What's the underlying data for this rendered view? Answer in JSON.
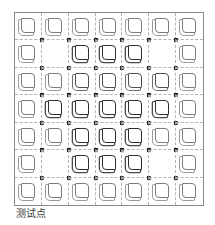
{
  "figure": {
    "caption": "测试点",
    "rows": 7,
    "cols": 7,
    "colors": {
      "border": "#8a8a8a",
      "grid_dashed": "#b5b5b5",
      "pad_normal": "#7c7c7c",
      "pad_medium": "#4f4f4f",
      "pad_bold": "#2e2e2e",
      "test_point": "#3a3a3a"
    },
    "cells": [
      [
        "normal",
        "normal",
        "normal",
        "normal",
        "normal",
        "normal",
        "normal"
      ],
      [
        "normal",
        "empty",
        "bold",
        "bold",
        "bold",
        "empty",
        "normal"
      ],
      [
        "normal",
        "normal",
        "medium",
        "medium",
        "medium",
        "medium",
        "normal"
      ],
      [
        "normal",
        "bold",
        "bold",
        "bold",
        "bold",
        "bold",
        "normal"
      ],
      [
        "normal",
        "normal",
        "bold",
        "bold",
        "bold",
        "normal",
        "normal"
      ],
      [
        "normal",
        "empty",
        "bold",
        "bold",
        "bold",
        "empty",
        "normal"
      ],
      [
        "normal",
        "normal",
        "normal",
        "normal",
        "normal",
        "normal",
        "normal"
      ]
    ],
    "test_point_label": "×",
    "test_points": "interior grid intersections (6×6)"
  }
}
